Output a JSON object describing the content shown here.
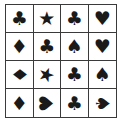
{
  "grid": {
    "rows": 4,
    "cols": 4,
    "color": "#1a1a1a",
    "cells": [
      {
        "icon": "club-icon",
        "glyph": "♣",
        "rotation": 0
      },
      {
        "icon": "star-icon",
        "glyph": "★",
        "rotation": 0
      },
      {
        "icon": "club-icon",
        "glyph": "♣",
        "rotation": 0
      },
      {
        "icon": "heart-icon",
        "glyph": "♥",
        "rotation": 0
      },
      {
        "icon": "diamond-icon",
        "glyph": "♦",
        "rotation": 0
      },
      {
        "icon": "club-icon",
        "glyph": "♣",
        "rotation": 0
      },
      {
        "icon": "spade-icon",
        "glyph": "♠",
        "rotation": 0
      },
      {
        "icon": "heart-icon",
        "glyph": "♥",
        "rotation": 0
      },
      {
        "icon": "diamond-icon",
        "glyph": "♦",
        "rotation": 90
      },
      {
        "icon": "star-icon",
        "glyph": "★",
        "rotation": 20
      },
      {
        "icon": "club-icon",
        "glyph": "♣",
        "rotation": 0
      },
      {
        "icon": "spade-icon",
        "glyph": "♠",
        "rotation": 0
      },
      {
        "icon": "diamond-icon",
        "glyph": "♦",
        "rotation": 0
      },
      {
        "icon": "heart-icon",
        "glyph": "♥",
        "rotation": -90
      },
      {
        "icon": "club-icon",
        "glyph": "♣",
        "rotation": 0
      },
      {
        "icon": "spade-icon",
        "glyph": "♠",
        "rotation": 90
      }
    ]
  }
}
